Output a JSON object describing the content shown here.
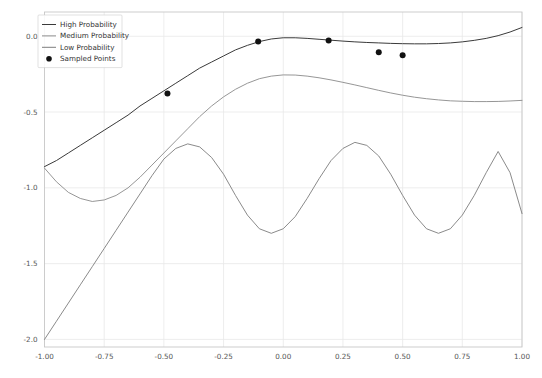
{
  "chart_data": {
    "type": "line",
    "title": "",
    "xlabel": "",
    "ylabel": "",
    "xlim": [
      -1.0,
      1.0
    ],
    "ylim": [
      -2.05,
      0.16
    ],
    "grid": true,
    "legend_position": "upper-left",
    "xticks": [
      -1.0,
      -0.75,
      -0.5,
      -0.25,
      0.0,
      0.25,
      0.5,
      0.75,
      1.0
    ],
    "xtick_labels": [
      "-1.00",
      "-0.75",
      "-0.50",
      "-0.25",
      "0.00",
      "0.25",
      "0.50",
      "0.75",
      "1.00"
    ],
    "yticks": [
      0.0,
      -0.5,
      -1.0,
      -1.5,
      -2.0
    ],
    "ytick_labels": [
      "0.0",
      "-0.5",
      "-1.0",
      "-1.5",
      "-2.0"
    ],
    "series": [
      {
        "name": "High Probability",
        "color": "#3a3a3a",
        "width": 1.0,
        "x": [
          -1.0,
          -0.95,
          -0.9,
          -0.85,
          -0.8,
          -0.75,
          -0.7,
          -0.65,
          -0.6,
          -0.55,
          -0.5,
          -0.45,
          -0.4,
          -0.35,
          -0.3,
          -0.25,
          -0.2,
          -0.15,
          -0.1,
          -0.05,
          0.0,
          0.05,
          0.1,
          0.15,
          0.2,
          0.25,
          0.3,
          0.35,
          0.4,
          0.45,
          0.5,
          0.55,
          0.6,
          0.65,
          0.7,
          0.75,
          0.8,
          0.85,
          0.9,
          0.95,
          1.0
        ],
        "y": [
          -0.86,
          -0.82,
          -0.77,
          -0.72,
          -0.67,
          -0.62,
          -0.57,
          -0.52,
          -0.46,
          -0.41,
          -0.36,
          -0.31,
          -0.26,
          -0.21,
          -0.17,
          -0.13,
          -0.09,
          -0.06,
          -0.035,
          -0.018,
          -0.01,
          -0.01,
          -0.014,
          -0.02,
          -0.026,
          -0.032,
          -0.037,
          -0.041,
          -0.044,
          -0.047,
          -0.049,
          -0.05,
          -0.05,
          -0.048,
          -0.044,
          -0.037,
          -0.027,
          -0.014,
          0.004,
          0.028,
          0.058
        ]
      },
      {
        "name": "Medium Probability",
        "color": "#8a8a8a",
        "width": 0.9,
        "x": [
          -1.0,
          -0.95,
          -0.9,
          -0.85,
          -0.8,
          -0.75,
          -0.7,
          -0.65,
          -0.6,
          -0.55,
          -0.5,
          -0.45,
          -0.4,
          -0.35,
          -0.3,
          -0.25,
          -0.2,
          -0.15,
          -0.1,
          -0.05,
          0.0,
          0.05,
          0.1,
          0.15,
          0.2,
          0.25,
          0.3,
          0.35,
          0.4,
          0.45,
          0.5,
          0.55,
          0.6,
          0.65,
          0.7,
          0.75,
          0.8,
          0.85,
          0.9,
          0.95,
          1.0
        ],
        "y": [
          -0.87,
          -0.96,
          -1.03,
          -1.07,
          -1.09,
          -1.08,
          -1.05,
          -1.0,
          -0.93,
          -0.85,
          -0.77,
          -0.69,
          -0.61,
          -0.53,
          -0.46,
          -0.4,
          -0.35,
          -0.31,
          -0.28,
          -0.263,
          -0.255,
          -0.256,
          -0.263,
          -0.274,
          -0.288,
          -0.304,
          -0.321,
          -0.339,
          -0.357,
          -0.374,
          -0.389,
          -0.402,
          -0.412,
          -0.42,
          -0.426,
          -0.429,
          -0.431,
          -0.431,
          -0.43,
          -0.427,
          -0.423
        ]
      },
      {
        "name": "Low Probability",
        "color": "#7d7d7d",
        "width": 0.9,
        "x": [
          -1.0,
          -0.95,
          -0.9,
          -0.85,
          -0.8,
          -0.75,
          -0.7,
          -0.65,
          -0.6,
          -0.55,
          -0.5,
          -0.45,
          -0.4,
          -0.35,
          -0.3,
          -0.25,
          -0.2,
          -0.15,
          -0.1,
          -0.05,
          0.0,
          0.05,
          0.1,
          0.15,
          0.2,
          0.25,
          0.3,
          0.35,
          0.4,
          0.45,
          0.5,
          0.55,
          0.6,
          0.65,
          0.7,
          0.75,
          0.8,
          0.85,
          0.9,
          0.95,
          1.0
        ],
        "y": [
          -2.0,
          -1.88,
          -1.76,
          -1.64,
          -1.52,
          -1.4,
          -1.28,
          -1.16,
          -1.04,
          -0.92,
          -0.81,
          -0.74,
          -0.71,
          -0.73,
          -0.8,
          -0.91,
          -1.05,
          -1.18,
          -1.27,
          -1.3,
          -1.27,
          -1.19,
          -1.07,
          -0.94,
          -0.82,
          -0.74,
          -0.7,
          -0.72,
          -0.79,
          -0.91,
          -1.05,
          -1.18,
          -1.27,
          -1.3,
          -1.27,
          -1.18,
          -1.05,
          -0.9,
          -0.76,
          -0.9,
          -1.17
        ]
      }
    ],
    "scatter": {
      "name": "Sampled Points",
      "color": "#111111",
      "marker": "circle",
      "size": 3.0,
      "points": [
        {
          "x": -0.485,
          "y": -0.377
        },
        {
          "x": -0.105,
          "y": -0.034
        },
        {
          "x": 0.19,
          "y": -0.028
        },
        {
          "x": 0.4,
          "y": -0.105
        },
        {
          "x": 0.5,
          "y": -0.125
        }
      ]
    },
    "legend_entries": [
      {
        "label": "High Probability",
        "type": "line",
        "color": "#3a3a3a"
      },
      {
        "label": "Medium Probability",
        "type": "line",
        "color": "#8a8a8a"
      },
      {
        "label": "Low Probability",
        "type": "line",
        "color": "#7d7d7d"
      },
      {
        "label": "Sampled Points",
        "type": "marker",
        "color": "#111111"
      }
    ]
  }
}
